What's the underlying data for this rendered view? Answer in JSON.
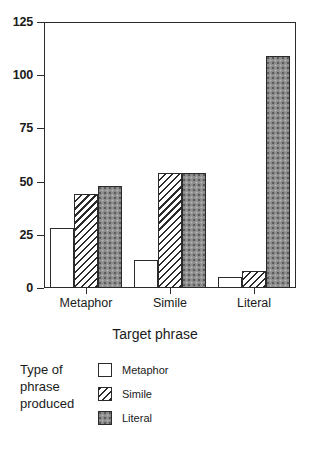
{
  "chart_data": {
    "type": "bar",
    "title": "",
    "xlabel": "Target phrase",
    "ylabel": "",
    "ylim": [
      0,
      125
    ],
    "yticks": [
      0,
      25,
      50,
      75,
      100,
      125
    ],
    "ytick_labels": [
      "0",
      "25",
      "50",
      "75",
      "100",
      "125"
    ],
    "grid": false,
    "legend_position": "below-left",
    "legend_title": "Type of phrase produced",
    "categories": [
      "Metaphor",
      "Simile",
      "Literal"
    ],
    "series": [
      {
        "name": "Metaphor",
        "fill": "white",
        "values": [
          28,
          13,
          5
        ]
      },
      {
        "name": "Simile",
        "fill": "hatch",
        "values": [
          44,
          54,
          8
        ]
      },
      {
        "name": "Literal",
        "fill": "stipple",
        "values": [
          48,
          54,
          109
        ]
      }
    ],
    "colors": {
      "axis": "#2b2b2b",
      "metaphor": "#ffffff",
      "simile": "#ffffff",
      "literal": "#8d8d8d",
      "background": "#ffffff"
    }
  }
}
